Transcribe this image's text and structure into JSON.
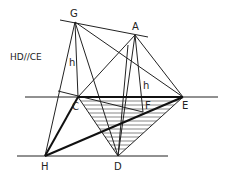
{
  "diagram": {
    "annotation": "HD//CE",
    "points": {
      "G": {
        "label": "G",
        "x": 75,
        "y": 22,
        "lx": 70,
        "ly": 17
      },
      "A": {
        "label": "A",
        "x": 135,
        "y": 35,
        "lx": 132,
        "ly": 30
      },
      "C": {
        "label": "C",
        "x": 78,
        "y": 97,
        "lx": 72,
        "ly": 110
      },
      "E": {
        "label": "E",
        "x": 183,
        "y": 97,
        "lx": 182,
        "ly": 108
      },
      "F": {
        "label": "F",
        "x": 143,
        "y": 112,
        "lx": 144,
        "ly": 108
      },
      "H": {
        "label": "H",
        "x": 45,
        "y": 156,
        "lx": 41,
        "ly": 170
      },
      "D": {
        "label": "D",
        "x": 118,
        "y": 156,
        "lx": 115,
        "ly": 170
      }
    },
    "heights": [
      {
        "label": "h",
        "x": 70,
        "y": 64
      },
      {
        "label": "h",
        "x": 144,
        "y": 87
      }
    ],
    "colors": {
      "line": "#222222",
      "hatch": "#555555",
      "background": "#ffffff"
    }
  }
}
